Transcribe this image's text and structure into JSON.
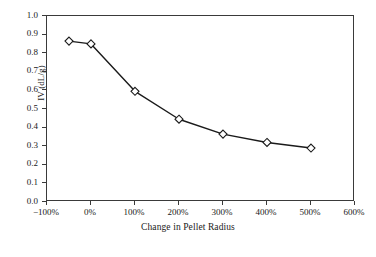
{
  "chart_data": {
    "type": "line",
    "title": "",
    "xlabel": "Change in Pellet Radius",
    "ylabel": "IV (dL/g)",
    "x": [
      -50,
      0,
      100,
      200,
      300,
      400,
      500
    ],
    "values": [
      0.865,
      0.85,
      0.595,
      0.445,
      0.365,
      0.32,
      0.29
    ],
    "series": [
      {
        "name": "IV",
        "x": [
          -50,
          0,
          100,
          200,
          300,
          400,
          500
        ],
        "values": [
          0.865,
          0.85,
          0.595,
          0.445,
          0.365,
          0.32,
          0.29
        ]
      }
    ],
    "xlim": [
      -100,
      600
    ],
    "ylim": [
      0.0,
      1.0
    ],
    "xticks": [
      -100,
      0,
      100,
      200,
      300,
      400,
      500,
      600
    ],
    "xtick_labels": [
      "−100%",
      "0%",
      "100%",
      "200%",
      "300%",
      "400%",
      "500%",
      "600%"
    ],
    "yticks": [
      0.0,
      0.1,
      0.2,
      0.3,
      0.4,
      0.5,
      0.6,
      0.7,
      0.8,
      0.9,
      1.0
    ],
    "ytick_labels": [
      "0.0",
      "0.1",
      "0.2",
      "0.3",
      "0.4",
      "0.5",
      "0.6",
      "0.7",
      "0.8",
      "0.9",
      "1.0"
    ],
    "grid": false,
    "legend": "none",
    "marker": "open-diamond",
    "line_color": "#1a1a1a",
    "marker_face_color": "#ffffff",
    "marker_edge_color": "#1a1a1a",
    "frame_color": "#3a3a3a",
    "background_color": "#ffffff"
  }
}
